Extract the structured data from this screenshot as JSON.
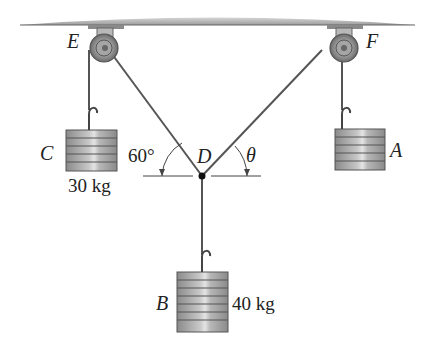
{
  "diagram": {
    "type": "pulley-statics",
    "points": {
      "E": "E",
      "F": "F",
      "D": "D"
    },
    "masses": {
      "A": {
        "label": "A",
        "mass": ""
      },
      "B": {
        "label": "B",
        "mass": "40 kg"
      },
      "C": {
        "label": "C",
        "mass": "30 kg"
      }
    },
    "angles": {
      "left": "60°",
      "right": "θ"
    },
    "colors": {
      "ceiling": "#a8a8a8",
      "cable": "#555555",
      "weight": "#9a9a9a",
      "pulley": "#7d7d7d"
    }
  }
}
